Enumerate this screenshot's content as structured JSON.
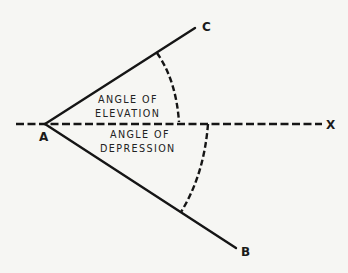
{
  "diagram": {
    "points": {
      "A": {
        "label": "A"
      },
      "B": {
        "label": "B"
      },
      "C": {
        "label": "C"
      },
      "X": {
        "label": "X"
      }
    },
    "angles": {
      "elevation": {
        "line1": "ANGLE OF",
        "line2": "ELEVATION"
      },
      "depression": {
        "line1": "ANGLE OF",
        "line2": "DEPRESSION"
      }
    },
    "colors": {
      "background": "#f6f6f3",
      "ink": "#151515"
    }
  }
}
